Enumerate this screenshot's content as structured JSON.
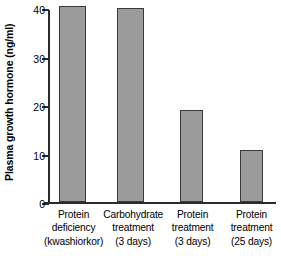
{
  "chart_data": {
    "type": "bar",
    "title": "",
    "xlabel": "",
    "ylabel": "Plasma growth hormone (ng/ml)",
    "ylim": [
      0,
      40
    ],
    "yticks": [
      0,
      10,
      20,
      30,
      40
    ],
    "ytick_labels": [
      "0",
      "10",
      "20",
      "30",
      "40"
    ],
    "grid": false,
    "legend": false,
    "bar_color": "#9b9b9b",
    "bar_edge_color": "#3a3a3a",
    "axis_color": "#2b2b2b",
    "background": "#ffffff",
    "categories": [
      "Protein deficiency (kwashiorkor)",
      "Carbohydrate treatment (3 days)",
      "Protein treatment (3 days)",
      "Protein treatment (25 days)"
    ],
    "category_lines": [
      [
        "Protein",
        "deficiency",
        "(kwashiorkor)"
      ],
      [
        "Carbohydrate",
        "treatment",
        "(3 days)"
      ],
      [
        "Protein",
        "treatment",
        "(3 days)"
      ],
      [
        "Protein",
        "treatment",
        "(25 days)"
      ]
    ],
    "values": [
      40.5,
      40.0,
      19.0,
      10.8
    ]
  },
  "axis": {
    "y_title": "Plasma growth hormone (ng/ml)",
    "tick_0": "0",
    "tick_10": "10",
    "tick_20": "20",
    "tick_30": "30",
    "tick_40": "40"
  },
  "categories": {
    "c0_l0": "Protein",
    "c0_l1": "deficiency",
    "c0_l2": "(kwashiorkor)",
    "c1_l0": "Carbohydrate",
    "c1_l1": "treatment",
    "c1_l2": "(3 days)",
    "c2_l0": "Protein",
    "c2_l1": "treatment",
    "c2_l2": "(3 days)",
    "c3_l0": "Protein",
    "c3_l1": "treatment",
    "c3_l2": "(25 days)"
  }
}
